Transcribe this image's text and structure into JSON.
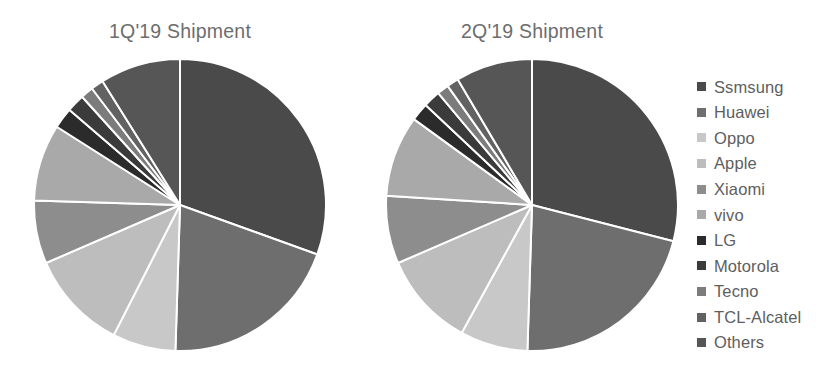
{
  "figure": {
    "background": "#ffffff",
    "title_color": "#6d6d6d",
    "legend_text_color": "#5e5e5e",
    "slice_border_color": "#ffffff"
  },
  "legend": {
    "position": "right",
    "items": [
      {
        "label": "Ssmsung",
        "color": "#4a4a4a"
      },
      {
        "label": "Huawei",
        "color": "#6e6e6e"
      },
      {
        "label": "Oppo",
        "color": "#c8c8c8"
      },
      {
        "label": "Apple",
        "color": "#bdbdbd"
      },
      {
        "label": "Xiaomi",
        "color": "#8d8d8d"
      },
      {
        "label": "vivo",
        "color": "#a9a9a9"
      },
      {
        "label": "LG",
        "color": "#2b2b2b"
      },
      {
        "label": "Motorola",
        "color": "#3b3b3b"
      },
      {
        "label": "Tecno",
        "color": "#7c7c7c"
      },
      {
        "label": "TCL-Alcatel",
        "color": "#626262"
      },
      {
        "label": "Others",
        "color": "#565656"
      }
    ]
  },
  "chart_data": [
    {
      "type": "pie",
      "title": "1Q'19 Shipment",
      "labels": [
        "Ssmsung",
        "Huawei",
        "Oppo",
        "Apple",
        "Xiaomi",
        "vivo",
        "LG",
        "Motorola",
        "Tecno",
        "TCL-Alcatel",
        "Others"
      ],
      "values": [
        30.5,
        20.0,
        7.0,
        11.0,
        7.0,
        8.5,
        2.3,
        2.0,
        1.4,
        1.4,
        8.9
      ],
      "unit": "% of shipments",
      "colors": [
        "#4a4a4a",
        "#6e6e6e",
        "#c8c8c8",
        "#bdbdbd",
        "#8d8d8d",
        "#a9a9a9",
        "#2b2b2b",
        "#3b3b3b",
        "#7c7c7c",
        "#626262",
        "#565656"
      ],
      "start_angle_deg": 0,
      "direction": "clockwise",
      "legend": "shared-right",
      "grid": false
    },
    {
      "type": "pie",
      "title": "2Q'19 Shipment",
      "labels": [
        "Ssmsung",
        "Huawei",
        "Oppo",
        "Apple",
        "Xiaomi",
        "vivo",
        "LG",
        "Motorola",
        "Tecno",
        "TCL-Alcatel",
        "Others"
      ],
      "values": [
        29.0,
        21.5,
        7.5,
        10.5,
        7.5,
        9.0,
        2.0,
        1.9,
        1.3,
        1.3,
        8.5
      ],
      "unit": "% of shipments",
      "colors": [
        "#4a4a4a",
        "#6e6e6e",
        "#c8c8c8",
        "#bdbdbd",
        "#8d8d8d",
        "#a9a9a9",
        "#2b2b2b",
        "#3b3b3b",
        "#7c7c7c",
        "#626262",
        "#565656"
      ],
      "start_angle_deg": 0,
      "direction": "clockwise",
      "legend": "shared-right",
      "grid": false
    }
  ]
}
